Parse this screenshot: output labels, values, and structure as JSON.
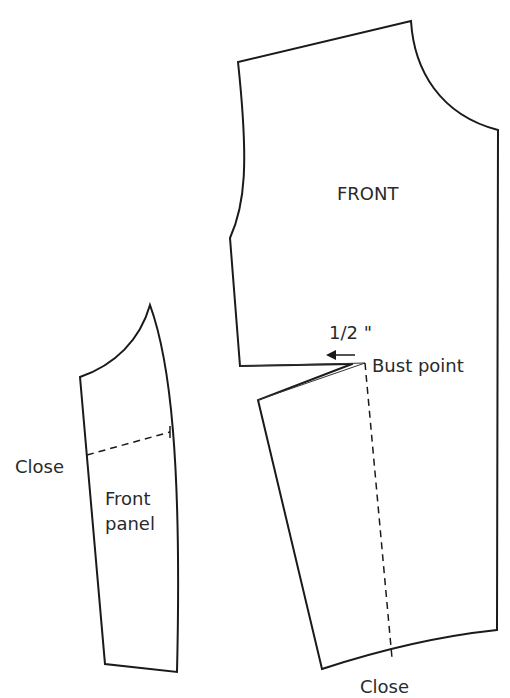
{
  "diagram": {
    "type": "sewing-pattern",
    "labels": {
      "front_piece": "FRONT",
      "measurement": "1/2 \"",
      "bust_point": "Bust point",
      "close_bottom": "Close",
      "close_panel": "Close",
      "panel_line1": "Front",
      "panel_line2": "panel"
    },
    "pieces": [
      {
        "name": "front",
        "label": "FRONT"
      },
      {
        "name": "front-panel",
        "label": "Front panel"
      }
    ],
    "colors": {
      "line": "#1a1a1a",
      "text": "#2a2a2a",
      "background": "#ffffff"
    }
  }
}
